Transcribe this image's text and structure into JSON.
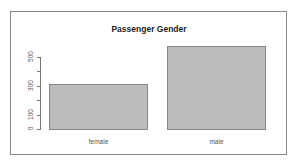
{
  "chart_data": {
    "type": "bar",
    "title": "Passenger Gender",
    "xlabel": "",
    "ylabel": "",
    "categories": [
      "female",
      "male"
    ],
    "values": [
      314,
      577
    ],
    "ylim": [
      0,
      600
    ],
    "yticks": [
      0,
      100,
      200,
      300,
      400,
      500
    ],
    "ytick_labels": [
      "0",
      "100",
      "",
      "300",
      "",
      "500"
    ],
    "grid": false,
    "legend": null,
    "bar_color": "#bcbcbc",
    "bar_border_color": "#888888"
  }
}
